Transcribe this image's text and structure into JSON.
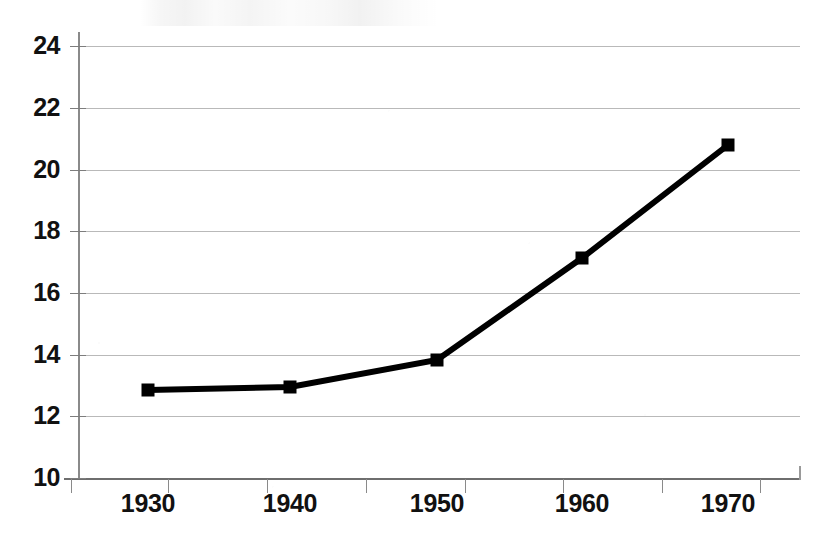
{
  "chart_data": {
    "type": "line",
    "title": "",
    "subtitle": "",
    "xlabel": "",
    "ylabel": "",
    "categories": [
      "1930",
      "1940",
      "1950",
      "1960",
      "1970"
    ],
    "values": [
      12.9,
      13.1,
      13.9,
      17.15,
      20.75
    ],
    "series": [
      {
        "name": "",
        "values": [
          12.9,
          13.1,
          13.9,
          17.15,
          20.75
        ]
      }
    ],
    "ylim": [
      10,
      24
    ],
    "ytick_labels": [
      "10",
      "12",
      "14",
      "16",
      "18",
      "20",
      "22",
      "24"
    ],
    "ytick_values": [
      10,
      12,
      14,
      16,
      18,
      20,
      22,
      24
    ],
    "xtick_labels": [
      "1930",
      "1940",
      "1950",
      "1960",
      "1970"
    ],
    "grid": true,
    "grid_axis": "y",
    "legend": false,
    "legend_position": "none",
    "marker": "square",
    "line_color": "#000000",
    "line_width_px": 6,
    "marker_color": "#000000",
    "grid_color": "#b9b9b9",
    "axis_color": "#7d7d7d",
    "background_color": "#ffffff",
    "text_color": "#111111",
    "annotations": []
  },
  "axes": {
    "y_labels": [
      {
        "text": "24",
        "value": 24,
        "y_px": 46
      },
      {
        "text": "22",
        "value": 22,
        "y_px": 108
      },
      {
        "text": "20",
        "value": 20,
        "y_px": 170
      },
      {
        "text": "18",
        "value": 18,
        "y_px": 231
      },
      {
        "text": "16",
        "value": 16,
        "y_px": 293
      },
      {
        "text": "14",
        "value": 14,
        "y_px": 355
      },
      {
        "text": "12",
        "value": 12,
        "y_px": 416
      },
      {
        "text": "10",
        "value": 10,
        "y_px": 478
      }
    ],
    "x_labels": [
      {
        "text": "1930",
        "x_px": 148
      },
      {
        "text": "1940",
        "x_px": 290
      },
      {
        "text": "1950",
        "x_px": 437
      },
      {
        "text": "1960",
        "x_px": 582
      },
      {
        "text": "1970",
        "x_px": 728
      }
    ],
    "x_tick_px": [
      71,
      168,
      267,
      366,
      465,
      563,
      662,
      760
    ],
    "points": [
      {
        "label": "1930",
        "value": 12.9,
        "x_px": 148,
        "y_px": 390
      },
      {
        "label": "1940",
        "value": 13.1,
        "x_px": 290,
        "y_px": 387
      },
      {
        "label": "1950",
        "value": 13.9,
        "x_px": 437,
        "y_px": 360
      },
      {
        "label": "1960",
        "value": 17.15,
        "x_px": 582,
        "y_px": 258
      },
      {
        "label": "1970",
        "value": 20.75,
        "x_px": 728,
        "y_px": 145
      }
    ]
  }
}
